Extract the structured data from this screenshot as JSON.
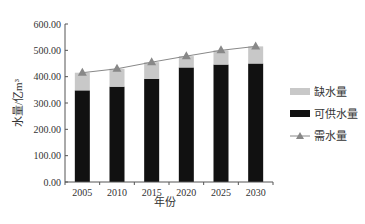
{
  "chart_data": {
    "type": "bar",
    "subtype": "stacked_bar_with_line",
    "title": "",
    "xlabel": "年份",
    "ylabel": "水量/亿m³",
    "ylim": [
      0,
      600
    ],
    "yticks": [
      "0.00",
      "100.00",
      "200.00",
      "300.00",
      "400.00",
      "500.00",
      "600.00"
    ],
    "categories": [
      "2005",
      "2010",
      "2015",
      "2020",
      "2025",
      "2030"
    ],
    "series": [
      {
        "name": "可供水量",
        "type": "bar",
        "stack": "total",
        "color": "#111111",
        "values": [
          348,
          362,
          392,
          435,
          446,
          450
        ]
      },
      {
        "name": "缺水量",
        "type": "bar",
        "stack": "total",
        "color": "#c8c8c8",
        "values": [
          67,
          68,
          63,
          43,
          54,
          65
        ]
      },
      {
        "name": "需水量",
        "type": "line",
        "marker": "triangle",
        "color": "#888888",
        "values": [
          415,
          430,
          455,
          478,
          500,
          515
        ]
      }
    ],
    "grid": false,
    "legend_position": "right"
  },
  "legend": {
    "items": [
      {
        "label": "缺水量",
        "color": "#c8c8c8",
        "kind": "bar"
      },
      {
        "label": "可供水量",
        "color": "#111111",
        "kind": "bar"
      },
      {
        "label": "需水量",
        "color": "#888888",
        "kind": "line-triangle"
      }
    ]
  }
}
